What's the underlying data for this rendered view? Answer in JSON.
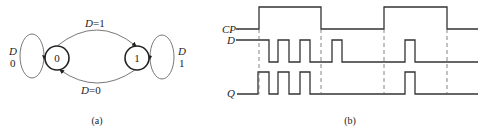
{
  "diagram_a": {
    "caption": "(a)",
    "states": [
      {
        "label": "0",
        "cx": 57,
        "cy": 58
      },
      {
        "label": "1",
        "cx": 137,
        "cy": 58
      }
    ],
    "transitions": {
      "top_label_var": "D",
      "top_label_val": "=1",
      "bottom_label_var": "D",
      "bottom_label_val": "=0"
    },
    "self_loops": {
      "left": {
        "var": "D",
        "val": "0"
      },
      "right": {
        "var": "D",
        "val": "1"
      }
    }
  },
  "diagram_b": {
    "caption": "(b)",
    "signals": [
      {
        "name": "CP"
      },
      {
        "name": "D"
      },
      {
        "name": "Q"
      }
    ]
  }
}
